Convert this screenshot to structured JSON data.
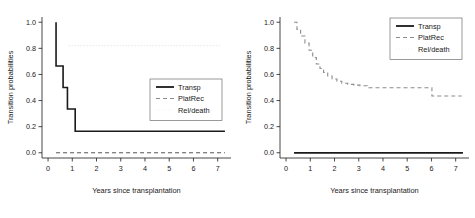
{
  "figure": {
    "panels": [
      {
        "id": "left",
        "axis": {
          "xlabel": "Years since transplantation",
          "ylabel": "Transition probabilities",
          "xticks": [
            "0",
            "1",
            "2",
            "3",
            "4",
            "5",
            "6",
            "7"
          ],
          "xtickvals": [
            0,
            1,
            2,
            3,
            4,
            5,
            6,
            7
          ],
          "yticks": [
            "0.0",
            "0.2",
            "0.4",
            "0.6",
            "0.8",
            "1.0"
          ],
          "ytickvals": [
            0.0,
            0.2,
            0.4,
            0.6,
            0.8,
            1.0
          ],
          "xlim": [
            -0.25,
            7.55
          ],
          "ylim": [
            -0.04,
            1.04
          ]
        },
        "legend": {
          "position": "right",
          "items": [
            {
              "label": "Transp",
              "style": "solid"
            },
            {
              "label": "PlatRec",
              "style": "dashed"
            },
            {
              "label": "Rel/death",
              "style": "dotted"
            }
          ]
        }
      },
      {
        "id": "right",
        "axis": {
          "xlabel": "Years since transplantation",
          "ylabel": "Transition probabilities",
          "xticks": [
            "0",
            "1",
            "2",
            "3",
            "4",
            "5",
            "6",
            "7"
          ],
          "xtickvals": [
            0,
            1,
            2,
            3,
            4,
            5,
            6,
            7
          ],
          "yticks": [
            "0.0",
            "0.2",
            "0.4",
            "0.6",
            "0.8",
            "1.0"
          ],
          "ytickvals": [
            0.0,
            0.2,
            0.4,
            0.6,
            0.8,
            1.0
          ],
          "xlim": [
            -0.25,
            7.55
          ],
          "ylim": [
            -0.04,
            1.04
          ]
        },
        "legend": {
          "position": "top-right",
          "items": [
            {
              "label": "Transp",
              "style": "solid"
            },
            {
              "label": "PlatRec",
              "style": "dashed"
            },
            {
              "label": "Rel/death",
              "style": "dotted"
            }
          ]
        }
      }
    ]
  },
  "chart_data": [
    {
      "type": "line",
      "panel": "left",
      "title": "",
      "xlabel": "Years since transplantation",
      "ylabel": "Transition probabilities",
      "xlim": [
        -0.25,
        7.55
      ],
      "ylim": [
        -0.04,
        1.04
      ],
      "grid": false,
      "legend": "right",
      "series": [
        {
          "name": "Transp",
          "style": "solid",
          "color": "#1a1a1a",
          "width": 1.6,
          "interpolation": "step-post",
          "x": [
            0.33,
            0.33,
            0.4,
            0.58,
            0.62,
            0.75,
            0.8,
            1.05,
            1.12,
            7.3
          ],
          "y": [
            1.0,
            0.665,
            0.665,
            0.665,
            0.5,
            0.5,
            0.335,
            0.335,
            0.165,
            0.165
          ]
        },
        {
          "name": "PlatRec",
          "style": "dashed",
          "color": "#555555",
          "width": 1.0,
          "interpolation": "step-post",
          "x": [
            0.33,
            7.3
          ],
          "y": [
            0.0,
            0.0
          ]
        },
        {
          "name": "Rel/death",
          "style": "dotted",
          "color": "#d8d8d8",
          "width": 1.0,
          "interpolation": "step-post",
          "x": [
            0.85,
            7.15
          ],
          "y": [
            0.82,
            0.82
          ]
        }
      ]
    },
    {
      "type": "line",
      "panel": "right",
      "title": "",
      "xlabel": "Years since transplantation",
      "ylabel": "Transition probabilities",
      "xlim": [
        -0.25,
        7.55
      ],
      "ylim": [
        -0.04,
        1.04
      ],
      "grid": false,
      "legend": "top-right",
      "series": [
        {
          "name": "Transp",
          "style": "solid",
          "color": "#1a1a1a",
          "width": 1.8,
          "interpolation": "step-post",
          "x": [
            0.33,
            7.3
          ],
          "y": [
            0.0,
            0.0
          ]
        },
        {
          "name": "PlatRec",
          "style": "dashed",
          "color": "#8c8c8c",
          "width": 1.1,
          "interpolation": "step-post",
          "x": [
            0.33,
            0.45,
            0.6,
            0.78,
            0.95,
            1.1,
            1.25,
            1.4,
            1.55,
            1.72,
            1.9,
            2.1,
            2.3,
            2.55,
            2.8,
            3.05,
            3.35,
            4.2,
            5.05,
            5.95,
            6.02,
            7.25
          ],
          "y": [
            1.0,
            0.945,
            0.895,
            0.84,
            0.785,
            0.73,
            0.68,
            0.645,
            0.615,
            0.588,
            0.565,
            0.548,
            0.533,
            0.524,
            0.518,
            0.513,
            0.498,
            0.498,
            0.498,
            0.498,
            0.435,
            0.435
          ]
        },
        {
          "name": "Rel/death",
          "style": "dotted",
          "color": "#e6e6e6",
          "width": 1.0,
          "interpolation": "step-post",
          "x": [],
          "y": []
        }
      ]
    }
  ]
}
